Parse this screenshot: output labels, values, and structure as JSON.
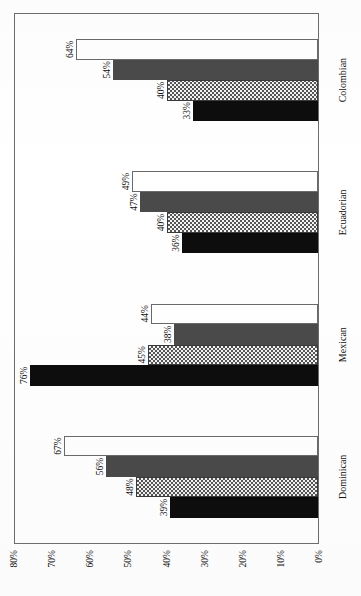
{
  "chart_data": {
    "type": "bar",
    "orientation": "vertical-rotated",
    "title": "",
    "subtitle": "",
    "xlabel": "",
    "ylabel": "",
    "categories": [
      "Dominican",
      "Mexican",
      "Ecuadorian",
      "Colombian"
    ],
    "series": [
      {
        "name": "1980",
        "values": [
          39,
          48,
          36,
          33
        ],
        "color": "#0d0d0d",
        "pattern": "solid-black"
      },
      {
        "name": "1990",
        "values": [
          48,
          45,
          40,
          40
        ],
        "color": "#f2f2f2",
        "pattern": "checkerboard"
      },
      {
        "name": "2000",
        "values": [
          56,
          38,
          47,
          54
        ],
        "color": "#4a4a4a",
        "pattern": "solid-gray"
      },
      {
        "name": "2005",
        "values": [
          67,
          44,
          49,
          64
        ],
        "color": "#ffffff",
        "pattern": "outline-white"
      }
    ],
    "series_by_category": {
      "Dominican": {
        "1980": 39,
        "1990": 48,
        "2000": 56,
        "2005": 67
      },
      "Mexican": {
        "1980": 76,
        "1990": 45,
        "2000": 38,
        "2005": 44
      },
      "Ecuadorian": {
        "1980": 36,
        "1990": 40,
        "2000": 47,
        "2005": 49
      },
      "Colombian": {
        "1980": 33,
        "1990": 40,
        "2000": 54,
        "2005": 64
      }
    },
    "data_labels": {
      "Dominican": [
        "39%",
        "48%",
        "56%",
        "67%"
      ],
      "Mexican": [
        "76%",
        "45%",
        "38%",
        "44%"
      ],
      "Ecuadorian": [
        "36%",
        "40%",
        "47%",
        "49%"
      ],
      "Colombian": [
        "33%",
        "40%",
        "54%",
        "64%"
      ]
    },
    "ylim": [
      0,
      80
    ],
    "ytick_labels": [
      "80%",
      "70%",
      "60%",
      "50%",
      "40%",
      "30%",
      "20%",
      "10%",
      "0%"
    ],
    "ytick_values": [
      80,
      70,
      60,
      50,
      40,
      30,
      20,
      10,
      0
    ],
    "grid": false,
    "legend_position": "right",
    "legend": [
      "1980",
      "1990",
      "2000",
      "2005"
    ]
  },
  "axis": {
    "ticks": [
      {
        "label": "80%",
        "value": 80
      },
      {
        "label": "70%",
        "value": 70
      },
      {
        "label": "60%",
        "value": 60
      },
      {
        "label": "50%",
        "value": 50
      },
      {
        "label": "40%",
        "value": 40
      },
      {
        "label": "30%",
        "value": 30
      },
      {
        "label": "20%",
        "value": 20
      },
      {
        "label": "10%",
        "value": 10
      },
      {
        "label": "0%",
        "value": 0
      }
    ]
  },
  "legend": {
    "items": [
      {
        "label": "1980",
        "swatch": "s1980"
      },
      {
        "label": "1990",
        "swatch": "s1990"
      },
      {
        "label": "2000",
        "swatch": "s2000"
      },
      {
        "label": "2005",
        "swatch": "s2005"
      }
    ]
  },
  "colors": {
    "series_1980": "#0d0d0d",
    "series_1990": "#f2f2f2",
    "series_2000": "#4a4a4a",
    "series_2005": "#ffffff",
    "frame": "#6d6d6d",
    "text": "#141414"
  }
}
